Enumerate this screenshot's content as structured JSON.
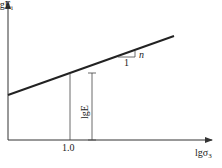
{
  "diagram": {
    "y_axis_label": "lgE",
    "y_axis_label_sub": "i",
    "x_axis_label": "lgσ",
    "x_axis_label_sub": "3",
    "x_tick_label": "1.0",
    "intercept_label": "lgE",
    "slope_run_label": "1",
    "slope_rise_label": "n",
    "line_color": "#222222"
  }
}
